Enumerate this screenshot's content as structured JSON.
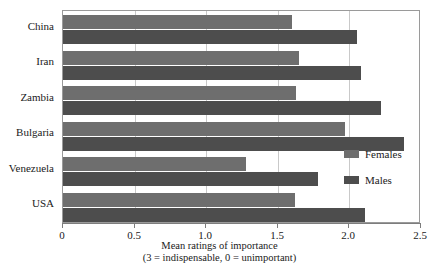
{
  "chart_data": {
    "type": "bar",
    "orientation": "horizontal",
    "title": "",
    "categories": [
      "China",
      "Iran",
      "Zambia",
      "Bulgaria",
      "Venezuela",
      "USA"
    ],
    "series": [
      {
        "name": "Females",
        "color": "#6e6e6e",
        "values": [
          1.6,
          1.65,
          1.63,
          1.97,
          1.28,
          1.62
        ]
      },
      {
        "name": "Males",
        "color": "#4d4d4d",
        "values": [
          2.05,
          2.08,
          2.22,
          2.38,
          1.78,
          2.11
        ]
      }
    ],
    "xlabel": "Mean ratings of importance",
    "xlabel_line2": "(3 = indispensable, 0 = unimportant)",
    "ylabel": "",
    "xlim": [
      0,
      2.5
    ],
    "xticks": [
      0,
      0.5,
      1.0,
      1.5,
      2.0,
      2.5
    ],
    "xtick_labels": [
      "0",
      "0.5",
      "1.0",
      "1.5",
      "2.0",
      "2.5"
    ],
    "grid": true,
    "legend_position": "right-middle"
  }
}
